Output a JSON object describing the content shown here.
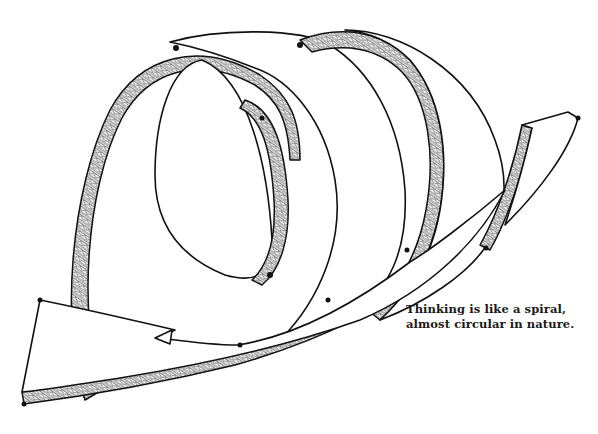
{
  "illustration": {
    "subject": "spiral ribbon drawing",
    "colors": {
      "ink": "#111111",
      "background": "#ffffff"
    }
  },
  "caption": {
    "line1": "Thinking is like a spiral,",
    "line2": "almost circular in nature."
  }
}
